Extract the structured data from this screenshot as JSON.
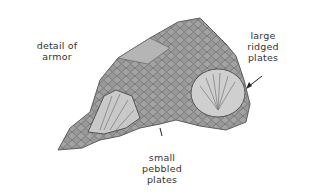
{
  "figure": {
    "labels": {
      "detail": [
        "detail of",
        "armor"
      ],
      "large": [
        "large",
        "ridged",
        "plates"
      ],
      "small": [
        "small",
        "pebbled",
        "plates"
      ]
    },
    "colors": {
      "armor_fill": "#9a9a9a",
      "armor_dark": "#5e5e5e",
      "plate_light": "#d6d6d6",
      "text": "#333333"
    }
  }
}
